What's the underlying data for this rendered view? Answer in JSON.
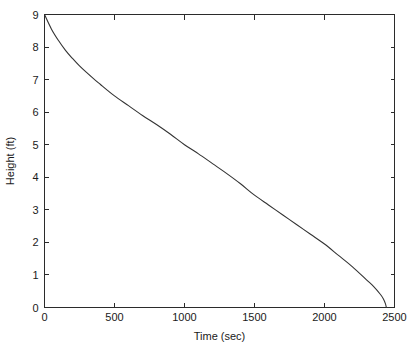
{
  "chart_data": {
    "type": "line",
    "title": "",
    "subtitle": "",
    "xlabel": "Time (sec)",
    "ylabel": "Height (ft)",
    "xlim": [
      0,
      2500
    ],
    "ylim": [
      0,
      9
    ],
    "xticks": [
      0,
      500,
      1000,
      1500,
      2000,
      2500
    ],
    "xtick_labels": [
      "0",
      "500",
      "1000",
      "1500",
      "2000",
      "2500"
    ],
    "yticks": [
      0,
      1,
      2,
      3,
      4,
      5,
      6,
      7,
      8,
      9
    ],
    "ytick_labels": [
      "0",
      "1",
      "2",
      "3",
      "4",
      "5",
      "6",
      "7",
      "8",
      "9"
    ],
    "grid": false,
    "legend": null,
    "legend_position": "none",
    "box_frame": true,
    "tick_direction": "in",
    "tick_sides": [
      "left",
      "bottom",
      "top",
      "right"
    ],
    "line_color": "#333333",
    "axis_color": "#2b2b2b",
    "background_color": "#ffffff",
    "series": [
      {
        "name": "Height",
        "x": [
          0,
          50,
          100,
          150,
          200,
          250,
          300,
          350,
          400,
          450,
          500,
          600,
          700,
          800,
          900,
          1000,
          1100,
          1200,
          1300,
          1400,
          1500,
          1600,
          1700,
          1800,
          1900,
          2000,
          2100,
          2200,
          2300,
          2350,
          2400,
          2420,
          2435,
          2442
        ],
        "y": [
          9.0,
          8.55,
          8.2,
          7.9,
          7.65,
          7.42,
          7.22,
          7.03,
          6.85,
          6.67,
          6.5,
          6.2,
          5.9,
          5.62,
          5.32,
          5.0,
          4.72,
          4.42,
          4.12,
          3.8,
          3.45,
          3.15,
          2.85,
          2.55,
          2.25,
          1.95,
          1.6,
          1.25,
          0.85,
          0.65,
          0.4,
          0.27,
          0.12,
          0.0
        ]
      }
    ],
    "annotations": []
  },
  "axes": {
    "x_axis_title": "Time (sec)",
    "y_axis_title": "Height (ft)"
  }
}
